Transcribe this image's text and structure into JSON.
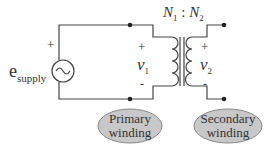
{
  "diagram": {
    "type": "transformer-circuit",
    "source": {
      "label": "e",
      "subscript": "supply",
      "plus": "+",
      "symbol": "ac-source"
    },
    "ratio": {
      "n1": "N",
      "n1_sub": "1",
      "sep": " : ",
      "n2": "N",
      "n2_sub": "2"
    },
    "primary_voltage": {
      "plus": "+",
      "label": "v",
      "sub": "1",
      "minus": "-"
    },
    "secondary_voltage": {
      "plus": "+",
      "label": "v",
      "sub": "2",
      "minus": "-"
    },
    "callouts": [
      {
        "line1": "Primary",
        "line2": "winding"
      },
      {
        "line1": "Secondary",
        "line2": "winding"
      }
    ],
    "colors": {
      "wire": "#444444",
      "bubble_fill": "#c8c8c8",
      "bubble_stroke": "#8a8a8a",
      "text": "#333333"
    }
  }
}
